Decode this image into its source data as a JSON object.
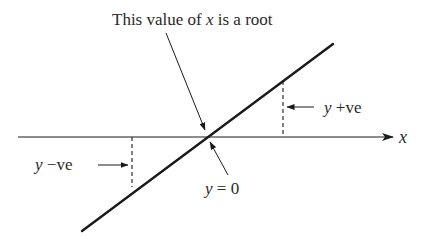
{
  "diagram": {
    "title": {
      "prefix": "This value of ",
      "var": "x",
      "suffix": " is a root"
    },
    "x_axis_label": "x",
    "labels": {
      "y_positive": {
        "var": "y",
        "text": " +ve"
      },
      "y_negative": {
        "var": "y",
        "text": " −ve"
      },
      "y_zero": {
        "var": "y",
        "text": " = 0"
      }
    },
    "colors": {
      "line": "#1a1a1a",
      "text": "#2a2a2a",
      "background": "#ffffff"
    }
  }
}
